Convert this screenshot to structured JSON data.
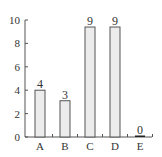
{
  "chart_data": {
    "type": "bar",
    "title": "",
    "xlabel": "",
    "ylabel": "",
    "categories": [
      "A",
      "B",
      "C",
      "D",
      "E"
    ],
    "values": [
      4,
      3,
      9,
      9,
      0
    ],
    "data_labels": [
      "4",
      "3",
      "9",
      "9",
      "0"
    ],
    "drawn_heights": [
      4,
      3.1,
      9.4,
      9.4,
      0.05
    ],
    "ylim": [
      0,
      10
    ],
    "yticks": [
      0,
      2,
      4,
      6,
      8,
      10
    ],
    "grid": false,
    "legend": null,
    "colors": {
      "bar_fill": "#ececec",
      "bar_stroke": "#555555",
      "axis": "#555555",
      "text": "#333333",
      "zero_bar": "#222222"
    }
  }
}
